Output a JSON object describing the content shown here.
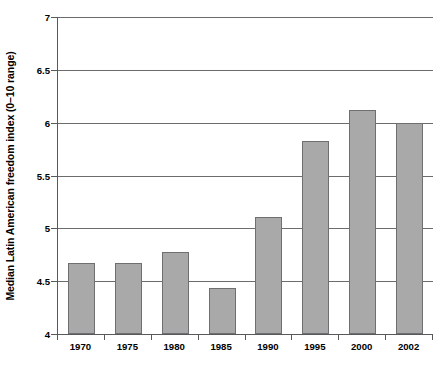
{
  "chart_data": {
    "type": "bar",
    "title": "",
    "xlabel": "",
    "ylabel": "Median Latin American freedom index (0–10 range)",
    "categories": [
      "1970",
      "1975",
      "1980",
      "1985",
      "1990",
      "1995",
      "2000",
      "2002"
    ],
    "values": [
      4.67,
      4.67,
      4.78,
      4.44,
      5.11,
      5.83,
      6.12,
      6.0
    ],
    "ylim": [
      4,
      7
    ],
    "yticks": [
      "4",
      "4.5",
      "5",
      "5.5",
      "6",
      "6.5",
      "7"
    ],
    "ytick_values": [
      4,
      4.5,
      5,
      5.5,
      6,
      6.5,
      7
    ],
    "grid": true,
    "legend": null,
    "legend_position": "none",
    "series": [
      {
        "name": "Median Latin American freedom index",
        "values": [
          4.67,
          4.67,
          4.78,
          4.44,
          5.11,
          5.83,
          6.12,
          6.0
        ]
      }
    ],
    "colors": {
      "bar_fill": "#a9a9a9",
      "bar_border": "#6e6f71",
      "gridline": "#6b6c6e",
      "axis": "#58595b",
      "background": "#ffffff",
      "text": "#000000"
    }
  },
  "caption": {
    "remnant": ""
  }
}
